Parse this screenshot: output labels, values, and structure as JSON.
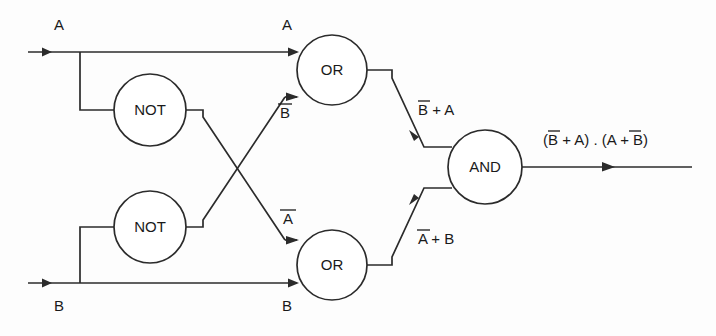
{
  "diagram": {
    "background_color": "#fdfdfd",
    "line_color": "#2b2b2b",
    "text_color": "#1a1a1a"
  },
  "gates": [
    {
      "id": "not-top",
      "label": "NOT",
      "cx": 150,
      "cy": 110
    },
    {
      "id": "not-bottom",
      "label": "NOT",
      "cx": 150,
      "cy": 227
    },
    {
      "id": "or-top",
      "label": "OR",
      "cx": 332,
      "cy": 70
    },
    {
      "id": "or-bottom",
      "label": "OR",
      "cx": 332,
      "cy": 265
    },
    {
      "id": "and",
      "label": "AND",
      "cx": 485,
      "cy": 167
    }
  ],
  "labels": {
    "input_a_left": "A",
    "input_b_left": "B",
    "input_a_gate": "A",
    "input_b_gate": "B",
    "not_a_out": "Ā",
    "not_b_out": "B̄",
    "or_top_out": "B̄ + A",
    "or_bottom_out": "Ā + B",
    "final_out": "(B̄ + A) . (Ā + B)"
  },
  "label_parts": {
    "not_b_out_base": "B",
    "not_a_out_base": "A",
    "or_top_out_pre": "B",
    "or_top_out_post": " + A",
    "or_bottom_out_pre": "A",
    "or_bottom_out_post": " + B",
    "final_out_p1": "(",
    "final_out_p2": "B",
    "final_out_p3": " + A) . (",
    "final_out_p4": "A",
    "final_out_p5": " + B)"
  }
}
